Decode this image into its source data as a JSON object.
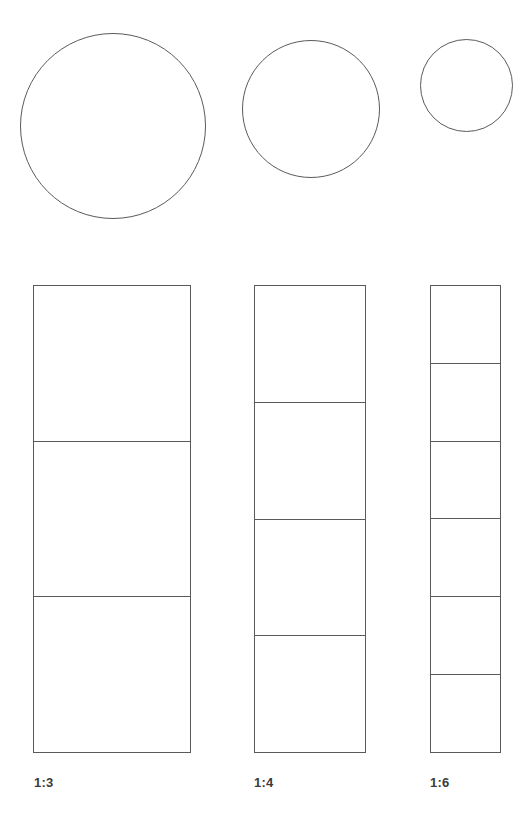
{
  "figure": {
    "background_color": "#ffffff",
    "stroke_color": "#5a5a5a",
    "label_color": "#3b3b3b",
    "canvas": {
      "width": 520,
      "height": 822
    }
  },
  "circles": [
    {
      "name": "large-circle",
      "label": "1:3",
      "left": 20,
      "top": 33,
      "diameter": 186,
      "stroke_width": 1.3
    },
    {
      "name": "medium-circle",
      "label": "1:4",
      "left": 242,
      "top": 40,
      "diameter": 138,
      "stroke_width": 1.3
    },
    {
      "name": "small-circle",
      "label": "1:6",
      "left": 420,
      "top": 39,
      "diameter": 93,
      "stroke_width": 1.3
    }
  ],
  "bars": [
    {
      "name": "bar-1-3",
      "ratio_label": "1:3",
      "segments": 3,
      "left": 33,
      "top": 285,
      "width": 158,
      "height": 468,
      "segment_height": 156,
      "stroke_width": 1.3,
      "label_left": 34,
      "label_top": 776
    },
    {
      "name": "bar-1-4",
      "ratio_label": "1:4",
      "segments": 4,
      "left": 254,
      "top": 285,
      "width": 112,
      "height": 468,
      "segment_height": 117,
      "stroke_width": 1.3,
      "label_left": 254,
      "label_top": 776
    },
    {
      "name": "bar-1-6",
      "ratio_label": "1:6",
      "segments": 6,
      "left": 430,
      "top": 285,
      "width": 71,
      "height": 468,
      "segment_height": 78,
      "stroke_width": 1.3,
      "label_left": 430,
      "label_top": 776
    }
  ],
  "chart_data": {
    "type": "diagram",
    "categories": [
      "1:3",
      "1:4",
      "1:6"
    ],
    "series": [
      {
        "name": "circle_diameter_px",
        "values": [
          186,
          138,
          93
        ]
      },
      {
        "name": "bar_width_px",
        "values": [
          158,
          112,
          71
        ]
      },
      {
        "name": "bar_segments",
        "values": [
          3,
          4,
          6
        ]
      },
      {
        "name": "segment_height_px",
        "values": [
          156,
          117,
          78
        ]
      }
    ],
    "bar_total_height_px": 468,
    "xlabel": "",
    "ylabel": "",
    "grid": false,
    "legend": "none"
  }
}
